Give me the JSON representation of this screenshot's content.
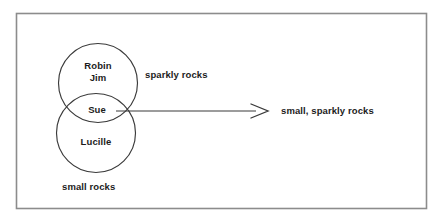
{
  "diagram": {
    "type": "venn-two-circle",
    "frame": {
      "border_color": "#8c8c8c",
      "background": "#ffffff"
    },
    "stroke_color": "#3a3a3a",
    "text_color": "#1c1c1c",
    "sets": [
      {
        "id": "sparkly-rocks",
        "label": "sparkly rocks",
        "members": [
          "Robin",
          "Jim"
        ],
        "position": "top"
      },
      {
        "id": "small-rocks",
        "label": "small rocks",
        "members": [
          "Lucille"
        ],
        "position": "bottom"
      }
    ],
    "intersection": {
      "label": "small, sparkly rocks",
      "members": [
        "Sue"
      ],
      "member_label": "Sue"
    },
    "members": {
      "robin": "Robin",
      "jim": "Jim",
      "sue": "Sue",
      "lucille": "Lucille"
    },
    "set_labels": {
      "sparkly_rocks": "sparkly rocks",
      "small_rocks": "small rocks",
      "intersection": "small, sparkly rocks"
    },
    "arrow": {
      "name": "intersection-pointer",
      "from": "intersection-region",
      "to": "small, sparkly rocks",
      "style": "open-head-line"
    }
  }
}
